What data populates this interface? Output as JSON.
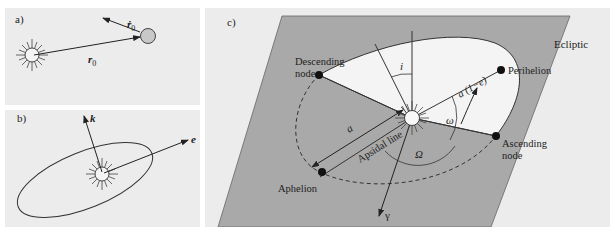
{
  "panels": {
    "a": {
      "label": "a)",
      "position_vector": "r",
      "position_subscript": "0",
      "velocity_vector": "ṙ",
      "velocity_subscript": "0"
    },
    "b": {
      "label": "b)",
      "angular_momentum_vector": "k",
      "eccentricity_vector": "e"
    },
    "c": {
      "label": "c)",
      "plane_label": "Ecliptic",
      "points": {
        "descending_node": [
          "Descending",
          "node"
        ],
        "ascending_node": [
          "Ascending",
          "node"
        ],
        "perihelion": "Perihelion",
        "aphelion": "Aphelion"
      },
      "symbols": {
        "inclination": "i",
        "perihelion_distance": "a (1−e)",
        "argument_of_perihelion": "ω",
        "longitude_of_ascending_node": "Ω",
        "semi_major_axis": "a",
        "vernal_equinox": "γ"
      },
      "apsidal_line_label": "Apsidal line"
    }
  },
  "colors": {
    "panel_background": "#ececec",
    "ecliptic_plane": "#a9a9a9",
    "orbit_fill": "#f4f4f4",
    "line": "#222222",
    "planet": "#c8c8c8"
  }
}
